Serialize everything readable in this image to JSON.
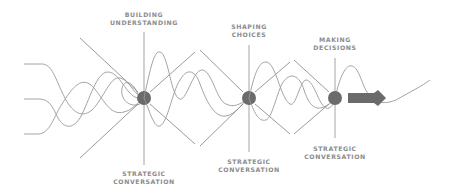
{
  "diagram": {
    "colors": {
      "line": "#9a9a9a",
      "node": "#6b6b6b",
      "label": "#8c8c8c",
      "background": "#ffffff"
    },
    "stages": [
      {
        "id": "building-understanding",
        "top_label": [
          "BUILDING",
          "UNDERSTANDING"
        ],
        "bottom_label": [
          "STRATEGIC",
          "CONVERSATION"
        ]
      },
      {
        "id": "shaping-choices",
        "top_label": [
          "SHAPING",
          "CHOICES"
        ],
        "bottom_label": [
          "STRATEGIC",
          "CONVERSATION"
        ]
      },
      {
        "id": "making-decisions",
        "top_label": [
          "MAKING",
          "DECISIONS"
        ],
        "bottom_label": [
          "STRATEGIC",
          "CONVERSATION"
        ]
      }
    ],
    "icons": {
      "node": "convergence-point",
      "output": "right-arrow"
    }
  }
}
